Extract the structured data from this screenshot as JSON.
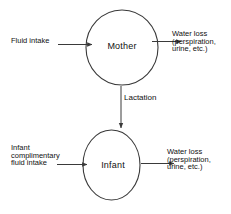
{
  "diagram": {
    "stroke_color": "#3a3a3a",
    "text_color": "#111111",
    "background_color": "#ffffff",
    "nodes": [
      {
        "id": "mother",
        "label": "Mother",
        "shape": "circle"
      },
      {
        "id": "infant",
        "label": "Infant",
        "shape": "circle"
      }
    ],
    "edges": [
      {
        "id": "fluid-intake-to-mother",
        "label_lines": [
          "Fluid intake"
        ],
        "from": "",
        "to": "mother",
        "direction": "right"
      },
      {
        "id": "mother-to-water-loss",
        "label_lines": [
          "Water loss",
          "(perspiration,",
          "urine, etc.)"
        ],
        "from": "mother",
        "to": "",
        "direction": "right"
      },
      {
        "id": "mother-to-infant",
        "label_lines": [
          "Lactation"
        ],
        "from": "mother",
        "to": "infant",
        "direction": "down"
      },
      {
        "id": "infant-fluid-intake-to-infant",
        "label_lines": [
          "Infant",
          "complimentary",
          "fluid intake"
        ],
        "from": "",
        "to": "infant",
        "direction": "right"
      },
      {
        "id": "infant-to-water-loss",
        "label_lines": [
          "Water loss",
          "(perspiration,",
          "urine, etc.)"
        ],
        "from": "infant",
        "to": "",
        "direction": "right"
      }
    ]
  }
}
